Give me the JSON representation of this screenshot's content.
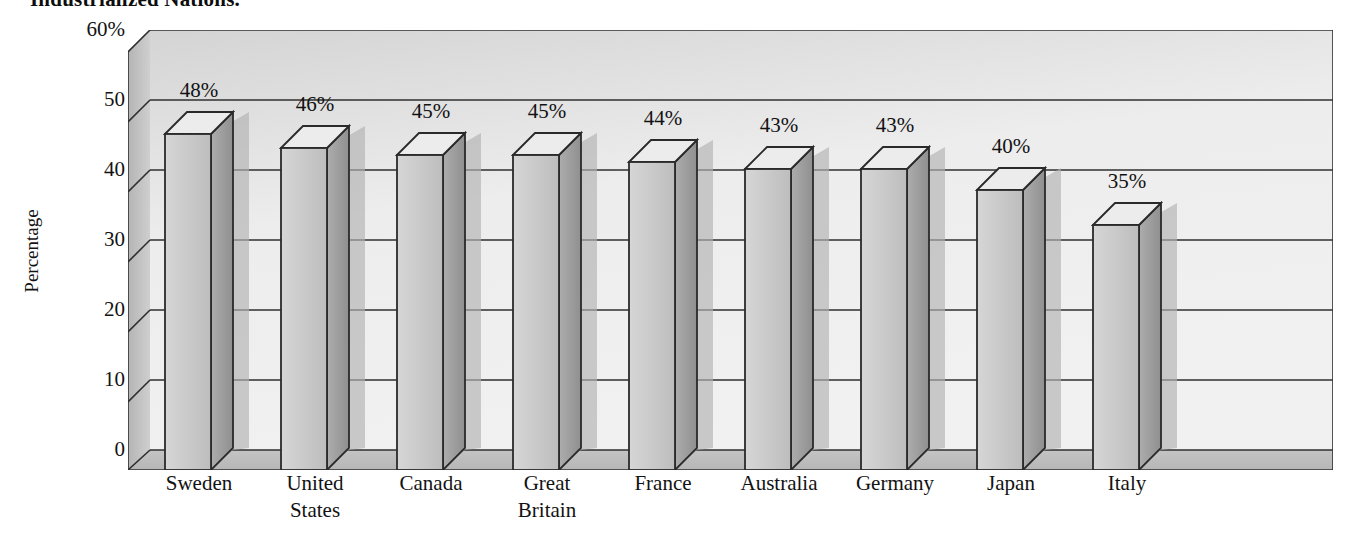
{
  "title": "Industrialized Nations.",
  "axis": {
    "y_title": "Percentage",
    "y_ticks": [
      "60%",
      "50",
      "40",
      "30",
      "20",
      "10",
      "0"
    ]
  },
  "colors": {
    "bar_front": "#c9c9c9",
    "bar_side": "#a0a0a0",
    "bar_top": "#ececec",
    "wall_back": "#ededed",
    "wall_left": "#c2c2c2",
    "floor": "#bdbdbd",
    "shadow": "#b3b3b3",
    "outline": "#2a2a2a",
    "text": "#121212"
  },
  "chart_data": {
    "type": "bar",
    "title": "Industrialized Nations.",
    "xlabel": "",
    "ylabel": "Percentage",
    "ylim": [
      0,
      60
    ],
    "ytick_values": [
      60,
      50,
      40,
      30,
      20,
      10,
      0
    ],
    "grid": true,
    "legend": "none",
    "style": "3d-column",
    "categories": [
      "Sweden",
      "United States",
      "Canada",
      "Great Britain",
      "France",
      "Australia",
      "Germany",
      "Japan",
      "Italy"
    ],
    "category_lines": [
      [
        "Sweden"
      ],
      [
        "United",
        "States"
      ],
      [
        "Canada"
      ],
      [
        "Great",
        "Britain"
      ],
      [
        "France"
      ],
      [
        "Australia"
      ],
      [
        "Germany"
      ],
      [
        "Japan"
      ],
      [
        "Italy"
      ]
    ],
    "values": [
      48,
      46,
      45,
      45,
      44,
      43,
      43,
      40,
      35
    ],
    "data_labels": [
      "48%",
      "46%",
      "45%",
      "45%",
      "44%",
      "43%",
      "43%",
      "40%",
      "35%"
    ],
    "units": "percent"
  }
}
